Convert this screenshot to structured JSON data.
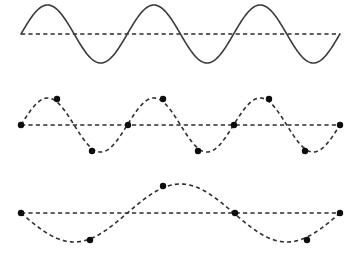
{
  "figure": {
    "background_color": "#ffffff",
    "width": 359,
    "height": 262,
    "curve_color": "#3a3a3a",
    "dash_color": "#2e2e2e",
    "dot_color": "#0d0d0d",
    "dot_radius": 3.2
  },
  "chart_data": {
    "type": "line",
    "subtitle": "",
    "xlabel": "",
    "ylabel": "",
    "grid": false,
    "legend": null,
    "annotations": [],
    "x_domain": [
      21,
      340
    ],
    "series": [
      {
        "name": "wave-top",
        "style": "solid",
        "cycles": 3,
        "wavelength_px": 106.3,
        "amplitude_px": 29,
        "phase": "sine",
        "baseline_y": 34,
        "crest_y": 5,
        "trough_y": 63,
        "x_start": 21,
        "x_end": 340,
        "has_axis_line": true,
        "markers": []
      },
      {
        "name": "wave-middle",
        "style": "dashed",
        "cycles": 3,
        "wavelength_px": 106.3,
        "amplitude_px": 27,
        "phase": "sine",
        "baseline_y": 125,
        "crest_y": 98,
        "trough_y": 152,
        "x_start": 21,
        "x_end": 340,
        "has_axis_line": true,
        "markers": [
          {
            "x": 21,
            "y": 125,
            "position": "zero-crossing-start"
          },
          {
            "x": 57,
            "y": 99,
            "position": "after-crest-1"
          },
          {
            "x": 92,
            "y": 151,
            "position": "after-trough-1"
          },
          {
            "x": 128,
            "y": 125,
            "position": "zero-crossing-1"
          },
          {
            "x": 163,
            "y": 99,
            "position": "after-crest-2"
          },
          {
            "x": 198,
            "y": 151,
            "position": "after-trough-2"
          },
          {
            "x": 234,
            "y": 125,
            "position": "zero-crossing-2"
          },
          {
            "x": 269,
            "y": 99,
            "position": "after-crest-3"
          },
          {
            "x": 305,
            "y": 151,
            "position": "after-trough-3"
          },
          {
            "x": 340,
            "y": 125,
            "position": "zero-crossing-end"
          }
        ]
      },
      {
        "name": "wave-bottom",
        "style": "dashed",
        "cycles": 1.5,
        "wavelength_px": 212.7,
        "amplitude_px": 29,
        "phase": "inverted-sine",
        "baseline_y": 213,
        "crest_y": 184,
        "trough_y": 242,
        "x_start": 21,
        "x_end": 340,
        "has_axis_line": true,
        "markers": [
          {
            "x": 21,
            "y": 213,
            "position": "zero-crossing-start"
          },
          {
            "x": 90,
            "y": 240,
            "position": "after-trough-1"
          },
          {
            "x": 163,
            "y": 186,
            "position": "near-crest-1"
          },
          {
            "x": 235,
            "y": 213,
            "position": "zero-crossing-1"
          },
          {
            "x": 307,
            "y": 240,
            "position": "after-trough-2"
          },
          {
            "x": 340,
            "y": 213,
            "position": "zero-crossing-end"
          }
        ]
      }
    ]
  }
}
